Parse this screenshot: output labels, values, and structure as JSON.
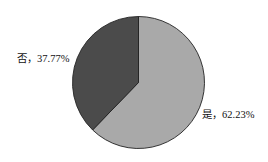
{
  "chart_data": {
    "type": "pie",
    "title": "",
    "categories": [
      "是",
      "否"
    ],
    "values": [
      62.23,
      37.77
    ],
    "labels": [
      "是，62.23%",
      "否，37.77%"
    ],
    "colors": [
      "#a9a9a9",
      "#4b4b4b"
    ],
    "start_angle": "12 o'clock, clockwise",
    "legend": "none (inline slice labels)"
  },
  "labels": {
    "yes": "是，62.23%",
    "no": "否，37.77%"
  }
}
